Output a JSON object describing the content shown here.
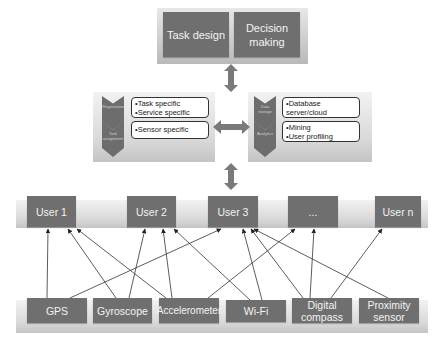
{
  "top": {
    "boxes": [
      {
        "label": "Task design"
      },
      {
        "label": "Decision making"
      }
    ]
  },
  "left_panel": {
    "stages": [
      {
        "label": "Registration",
        "items": [
          "Task specific",
          "Service specific"
        ]
      },
      {
        "label": "Task assignment",
        "items": [
          "Sensor specific"
        ]
      }
    ]
  },
  "right_panel": {
    "stages": [
      {
        "label": "Data storage",
        "items": [
          "Database server/cloud"
        ]
      },
      {
        "label": "Analytics",
        "items": [
          "Mining",
          "User profiling"
        ]
      }
    ]
  },
  "users": [
    {
      "label": "User 1"
    },
    {
      "label": "User 2"
    },
    {
      "label": "User 3"
    },
    {
      "label": "..."
    },
    {
      "label": "User n"
    }
  ],
  "sensors": [
    {
      "label": "GPS"
    },
    {
      "label": "Gyroscope"
    },
    {
      "label": "Accelerometer"
    },
    {
      "label": "Wi-Fi"
    },
    {
      "label": "Digital compass"
    },
    {
      "label": "Proximity sensor"
    }
  ],
  "connections": [
    {
      "from": "GPS",
      "to": "User 1"
    },
    {
      "from": "GPS",
      "to": "User 3"
    },
    {
      "from": "Gyroscope",
      "to": "User 1"
    },
    {
      "from": "Gyroscope",
      "to": "User 2"
    },
    {
      "from": "Accelerometer",
      "to": "User 1"
    },
    {
      "from": "Accelerometer",
      "to": "User 2"
    },
    {
      "from": "Accelerometer",
      "to": "..."
    },
    {
      "from": "Wi-Fi",
      "to": "User 2"
    },
    {
      "from": "Wi-Fi",
      "to": "User 3"
    },
    {
      "from": "Digital compass",
      "to": "User 3"
    },
    {
      "from": "Digital compass",
      "to": "..."
    },
    {
      "from": "Digital compass",
      "to": "User n"
    },
    {
      "from": "Proximity sensor",
      "to": "User 3"
    }
  ],
  "colors": {
    "box": "#6f6f6f",
    "box_text": "#f3f3f3",
    "arrow": "#7a7a7a",
    "line": "#333333"
  }
}
